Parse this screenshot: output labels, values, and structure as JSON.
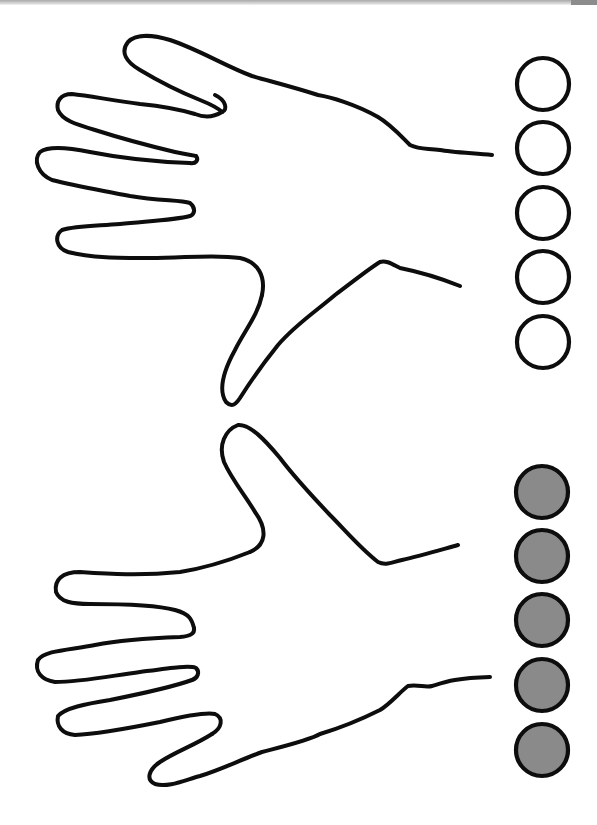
{
  "worksheet": {
    "description": "Counting worksheet: two hand outlines with five counting circles each",
    "hands": [
      {
        "id": "top-hand",
        "orientation": "fingers-left",
        "fingers": 5
      },
      {
        "id": "bottom-hand",
        "orientation": "fingers-left-mirrored",
        "fingers": 5
      }
    ],
    "counter_groups": [
      {
        "id": "empty-circles",
        "state": "empty",
        "fill": "#ffffff",
        "count": 5,
        "cx": 543,
        "r": 26,
        "centers_y": [
          84,
          148,
          213,
          277,
          342
        ]
      },
      {
        "id": "filled-circles",
        "state": "filled",
        "fill": "#8a8a8a",
        "count": 5,
        "cx": 542,
        "r": 26,
        "centers_y": [
          492,
          556,
          620,
          685,
          750
        ]
      }
    ],
    "colors": {
      "outline": "#0d0d0d",
      "filled_circle": "#8a8a8a",
      "background": "#ffffff",
      "scan_band": "#a9a9a9"
    }
  }
}
